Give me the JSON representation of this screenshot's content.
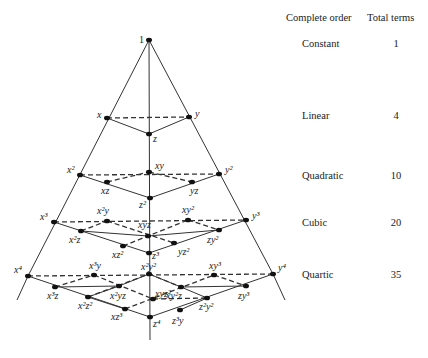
{
  "table": {
    "header_order": "Complete order",
    "header_terms": "Total terms",
    "rows": [
      {
        "order": "Constant",
        "terms": "1",
        "y": 44
      },
      {
        "order": "Linear",
        "terms": "4",
        "y": 117
      },
      {
        "order": "Quadratic",
        "terms": "10",
        "y": 177
      },
      {
        "order": "Cubic",
        "terms": "20",
        "y": 224
      },
      {
        "order": "Quartic",
        "terms": "35",
        "y": 276
      }
    ]
  },
  "diagram": {
    "colors": {
      "line": "#333333",
      "node": "#111111"
    },
    "nodes": [
      {
        "id": "1",
        "label": "1",
        "x": 149,
        "y": 40,
        "lx": -10,
        "ly": 3,
        "plain": true
      },
      {
        "id": "x",
        "label": "x",
        "x": 107,
        "y": 118,
        "lx": -10,
        "ly": 0
      },
      {
        "id": "y",
        "label": "y",
        "x": 189,
        "y": 117,
        "lx": 6,
        "ly": 0
      },
      {
        "id": "z",
        "label": "z",
        "x": 149,
        "y": 134,
        "lx": 4,
        "ly": 8
      },
      {
        "id": "x2",
        "label": "x²",
        "x": 80,
        "y": 175,
        "lx": -13,
        "ly": -2
      },
      {
        "id": "xy",
        "label": "xy",
        "x": 149,
        "y": 172,
        "lx": 6,
        "ly": -3
      },
      {
        "id": "y2",
        "label": "y²",
        "x": 219,
        "y": 174,
        "lx": 6,
        "ly": -1
      },
      {
        "id": "xz",
        "label": "xz",
        "x": 107,
        "y": 182,
        "lx": -6,
        "ly": 12
      },
      {
        "id": "yz",
        "label": "yz",
        "x": 192,
        "y": 182,
        "lx": -2,
        "ly": 12
      },
      {
        "id": "z2",
        "label": "z²",
        "x": 150,
        "y": 198,
        "lx": -11,
        "ly": 10
      },
      {
        "id": "x3",
        "label": "x³",
        "x": 54,
        "y": 222,
        "lx": -14,
        "ly": -2
      },
      {
        "id": "x2y",
        "label": "x²y",
        "x": 107,
        "y": 221,
        "lx": -10,
        "ly": -7
      },
      {
        "id": "xy2",
        "label": "xy²",
        "x": 188,
        "y": 220,
        "lx": -6,
        "ly": -7
      },
      {
        "id": "y3",
        "label": "y³",
        "x": 246,
        "y": 220,
        "lx": 6,
        "ly": -1
      },
      {
        "id": "x2z",
        "label": "x²z",
        "x": 81,
        "y": 231,
        "lx": -12,
        "ly": 12
      },
      {
        "id": "xyz",
        "label": "xyz",
        "x": 148,
        "y": 236,
        "lx": -10,
        "ly": -8
      },
      {
        "id": "zy2",
        "label": "zy²",
        "x": 219,
        "y": 230,
        "lx": -12,
        "ly": 13
      },
      {
        "id": "xz2",
        "label": "xz²",
        "x": 123,
        "y": 246,
        "lx": -11,
        "ly": 12
      },
      {
        "id": "yz2",
        "label": "yz²",
        "x": 174,
        "y": 243,
        "lx": 4,
        "ly": 12
      },
      {
        "id": "z3",
        "label": "z³",
        "x": 149,
        "y": 253,
        "lx": 3,
        "ly": 6
      },
      {
        "id": "x4",
        "label": "x⁴",
        "x": 28,
        "y": 276,
        "lx": -14,
        "ly": -3
      },
      {
        "id": "x3y",
        "label": "x³y",
        "x": 94,
        "y": 275,
        "lx": -5,
        "ly": -6
      },
      {
        "id": "x2y2",
        "label": "x²y²",
        "x": 149,
        "y": 274,
        "lx": -8,
        "ly": -4
      },
      {
        "id": "xy3",
        "label": "xy³",
        "x": 214,
        "y": 275,
        "lx": -5,
        "ly": -6
      },
      {
        "id": "y4",
        "label": "y⁴",
        "x": 273,
        "y": 274,
        "lx": 5,
        "ly": -3
      },
      {
        "id": "x3z",
        "label": "x³z",
        "x": 55,
        "y": 287,
        "lx": -8,
        "ly": 12
      },
      {
        "id": "x2yz",
        "label": "x²yz",
        "x": 119,
        "y": 286,
        "lx": -9,
        "ly": 13
      },
      {
        "id": "xy2z",
        "label": "xy²z",
        "x": 181,
        "y": 287,
        "lx": -15,
        "ly": 12
      },
      {
        "id": "zy3",
        "label": "zy³",
        "x": 246,
        "y": 286,
        "lx": -8,
        "ly": 13
      },
      {
        "id": "x2z2",
        "label": "x²z²",
        "x": 88,
        "y": 297,
        "lx": -10,
        "ly": 12
      },
      {
        "id": "xyz2",
        "label": "xyz²",
        "x": 153,
        "y": 299,
        "lx": 2,
        "ly": -2
      },
      {
        "id": "z2y2",
        "label": "z²y²",
        "x": 207,
        "y": 298,
        "lx": -8,
        "ly": 12
      },
      {
        "id": "xz3",
        "label": "xz³",
        "x": 125,
        "y": 309,
        "lx": -14,
        "ly": 11
      },
      {
        "id": "z3y",
        "label": "z³y",
        "x": 180,
        "y": 310,
        "lx": -8,
        "ly": 14
      },
      {
        "id": "z4",
        "label": "z⁴",
        "x": 150,
        "y": 317,
        "lx": 3,
        "ly": 10
      }
    ],
    "dashed_edges": [
      [
        "x",
        "y"
      ],
      [
        "x2",
        "y2"
      ],
      [
        "xz",
        "xy"
      ],
      [
        "xy",
        "yz"
      ],
      [
        "x3",
        "y3"
      ],
      [
        "x2z",
        "x2y"
      ],
      [
        "x2y",
        "yz2"
      ],
      [
        "xz2",
        "xy2"
      ],
      [
        "xy2",
        "zy2"
      ],
      [
        "x4",
        "y4"
      ],
      [
        "x3z",
        "x3y"
      ],
      [
        "x3y",
        "xyz2"
      ],
      [
        "xyz2",
        "z2y2"
      ],
      [
        "x2z2",
        "x2y2"
      ],
      [
        "xz3",
        "xy3"
      ],
      [
        "xy3",
        "zy3"
      ],
      [
        "x2y2",
        "xy2z"
      ]
    ],
    "solid_edges": [
      [
        "x",
        "z"
      ],
      [
        "z",
        "y"
      ],
      [
        "x2",
        "z2"
      ],
      [
        "z2",
        "y2"
      ],
      [
        "x3",
        "z3"
      ],
      [
        "z3",
        "y3"
      ],
      [
        "xyz",
        "x2z"
      ],
      [
        "xyz",
        "zy2"
      ],
      [
        "x4",
        "z4"
      ],
      [
        "z4",
        "y4"
      ],
      [
        "x2yz",
        "x2y2"
      ],
      [
        "x2y2",
        "xy2z"
      ],
      [
        "x2yz",
        "x2z2"
      ],
      [
        "xy2z",
        "z2y2"
      ],
      [
        "x2z2",
        "xz3"
      ],
      [
        "z2y2",
        "z3y"
      ],
      [
        "x3z",
        "x2yz"
      ],
      [
        "zy3",
        "xy2z"
      ]
    ],
    "axis_lines": {
      "vertical": [
        [
          149,
          40
        ],
        [
          150,
          340
        ]
      ],
      "left": [
        [
          149,
          40
        ],
        [
          28,
          276
        ],
        [
          17,
          300
        ]
      ],
      "right": [
        [
          149,
          40
        ],
        [
          273,
          274
        ],
        [
          285,
          300
        ]
      ]
    }
  }
}
